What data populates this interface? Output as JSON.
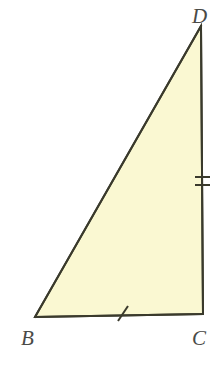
{
  "figure": {
    "background_color": "#ffffff",
    "fill_color": "#faf8d2",
    "stroke_color": "#3a3a2c",
    "label_color": "#4a4a46",
    "stroke_width": 2,
    "canvas": {
      "width": 221,
      "height": 379
    },
    "vertices": [
      {
        "id": "D",
        "label": "D",
        "x": 201,
        "y": 26,
        "label_x": 192,
        "label_y": 6
      },
      {
        "id": "B",
        "label": "B",
        "x": 35,
        "y": 317,
        "label_x": 21,
        "label_y": 328
      },
      {
        "id": "C",
        "label": "C",
        "x": 203,
        "y": 314,
        "label_x": 192,
        "label_y": 328
      }
    ],
    "sides": [
      {
        "id": "BD",
        "from": "B",
        "to": "D",
        "name": "hypotenuse",
        "tick_marks": 0
      },
      {
        "id": "DC",
        "from": "D",
        "to": "C",
        "name": "vertical-leg",
        "tick_marks": 2
      },
      {
        "id": "BC",
        "from": "B",
        "to": "C",
        "name": "horizontal-leg",
        "tick_marks": 1
      }
    ],
    "tick_marks": {
      "dc": {
        "count": 2,
        "orientation": "horizontal",
        "positions": [
          {
            "x1": 195,
            "y1": 177,
            "x2": 210,
            "y2": 177
          },
          {
            "x1": 195,
            "y1": 185,
            "x2": 210,
            "y2": 185
          }
        ]
      },
      "bc": {
        "count": 1,
        "orientation": "slanted",
        "positions": [
          {
            "x1": 118,
            "y1": 321,
            "x2": 128,
            "y2": 306
          }
        ]
      }
    },
    "polygon_points": "35,317 201,26 203,314"
  }
}
